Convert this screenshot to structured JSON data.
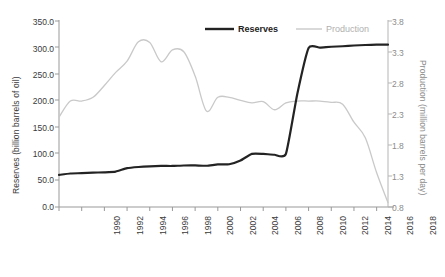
{
  "chart_data": {
    "type": "line",
    "title": "",
    "subtitle": "",
    "xlabel": "",
    "ylabel": "Reserves (billion barrels of oil)",
    "y2label": "Production (million barrels per day)",
    "grid": false,
    "legend_position": "top-center",
    "xlim": [
      1990,
      2019
    ],
    "ylim": [
      0.0,
      350.0
    ],
    "y2lim": [
      0.8,
      3.8
    ],
    "x": [
      1990,
      1991,
      1992,
      1993,
      1994,
      1995,
      1996,
      1997,
      1998,
      1999,
      2000,
      2001,
      2002,
      2003,
      2004,
      2005,
      2006,
      2007,
      2008,
      2009,
      2010,
      2011,
      2012,
      2013,
      2014,
      2015,
      2016,
      2017,
      2018,
      2019
    ],
    "xtick_labels": [
      "1990",
      "1992",
      "1994",
      "1996",
      "1998",
      "2000",
      "2002",
      "2004",
      "2006",
      "2008",
      "2010",
      "2012",
      "2014",
      "2016",
      "2018"
    ],
    "ytick_labels_left": [
      "350.0",
      "300.0",
      "250.0",
      "200.0",
      "150.0",
      "100.0",
      "50.0",
      "0.0"
    ],
    "ytick_values_left": [
      350.0,
      300.0,
      250.0,
      200.0,
      150.0,
      100.0,
      50.0,
      0.0
    ],
    "ytick_labels_right": [
      "3.8",
      "3.3",
      "2.8",
      "2.3",
      "1.8",
      "1.3",
      "0.8"
    ],
    "ytick_values_right": [
      3.8,
      3.3,
      2.8,
      2.3,
      1.8,
      1.3,
      0.8
    ],
    "series": [
      {
        "name": "Reserves",
        "axis": "left",
        "units": "billion barrels of oil",
        "color": "#232323",
        "line_width": 2.2,
        "values": [
          60.1,
          62.7,
          63.3,
          64.4,
          64.9,
          66.3,
          72.7,
          74.9,
          76.1,
          76.8,
          76.8,
          77.7,
          77.8,
          77.2,
          79.7,
          80.0,
          87.0,
          99.4,
          99.4,
          97.8,
          99.4,
          211.2,
          297.6,
          298.4,
          299.9,
          300.9,
          302.3,
          303.2,
          303.8,
          303.8
        ]
      },
      {
        "name": "Production",
        "axis": "right",
        "units": "million barrels per day",
        "color": "#c9c9c9",
        "line_width": 1.3,
        "values": [
          2.24,
          2.5,
          2.5,
          2.56,
          2.75,
          2.96,
          3.14,
          3.45,
          3.44,
          3.13,
          3.32,
          3.29,
          2.9,
          2.34,
          2.56,
          2.56,
          2.51,
          2.47,
          2.49,
          2.36,
          2.47,
          2.5,
          2.5,
          2.5,
          2.48,
          2.45,
          2.16,
          1.91,
          1.35,
          0.87
        ]
      }
    ],
    "legend": [
      {
        "label": "Reserves",
        "color": "#232323",
        "style": "thick-line"
      },
      {
        "label": "Production",
        "color": "#c9c9c9",
        "style": "thin-line"
      }
    ]
  },
  "axes": {
    "left_axis_color": "#999999",
    "right_axis_color": "#b5b5b5",
    "background": "#ffffff"
  }
}
